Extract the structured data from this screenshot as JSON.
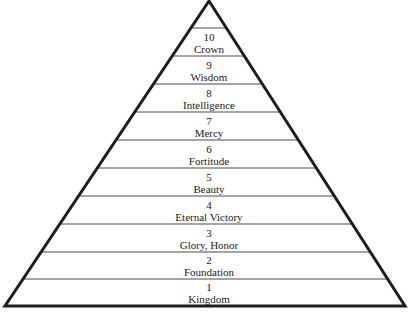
{
  "diagram": {
    "type": "pyramid",
    "levels": [
      {
        "number": "10",
        "name": "Crown"
      },
      {
        "number": "9",
        "name": "Wisdom"
      },
      {
        "number": "8",
        "name": "Intelligence"
      },
      {
        "number": "7",
        "name": "Mercy"
      },
      {
        "number": "6",
        "name": "Fortitude"
      },
      {
        "number": "5",
        "name": "Beauty"
      },
      {
        "number": "4",
        "name": "Eternal Victory"
      },
      {
        "number": "3",
        "name": "Glory, Honor"
      },
      {
        "number": "2",
        "name": "Foundation"
      },
      {
        "number": "1",
        "name": "Kingdom"
      }
    ],
    "colors": {
      "outline": "#1e1e1e",
      "divider": "#4a4a4a",
      "text": "#1a1a1a",
      "background": "#ffffff"
    }
  }
}
